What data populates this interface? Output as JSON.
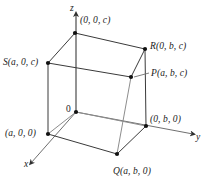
{
  "figure": {
    "colors": {
      "line": "#3a3a3a",
      "axis": "#4a4a4a",
      "vertex": "#111111",
      "text": "#1a1a1a",
      "background": "#ffffff"
    },
    "axes": [
      {
        "id": "x",
        "label": "x",
        "label_x": 24,
        "label_y": 166,
        "arrow": true
      },
      {
        "id": "y",
        "label": "y",
        "label_x": 196,
        "label_y": 139,
        "arrow": true
      },
      {
        "id": "z",
        "label": "z",
        "label_x": 70,
        "label_y": 5,
        "arrow": true
      }
    ],
    "points": [
      {
        "id": "top-back",
        "label": "(0, 0, c)",
        "label_x": 80,
        "label_y": 16,
        "px": 75,
        "py": 33,
        "dot": true
      },
      {
        "id": "R",
        "label": "R(0, b, c)",
        "label_x": 150,
        "label_y": 42,
        "px": 145,
        "py": 49,
        "dot": true
      },
      {
        "id": "S",
        "label": "S(a, 0, c)",
        "label_x": 3,
        "label_y": 58,
        "px": 48,
        "py": 63,
        "dot": true
      },
      {
        "id": "P",
        "label": "P(a, b, c)",
        "label_x": 151,
        "label_y": 69,
        "px": 131,
        "py": 77,
        "dot": true
      },
      {
        "id": "origin",
        "label": "0",
        "label_x": 66,
        "label_y": 105,
        "px": 76,
        "py": 112,
        "dot": true
      },
      {
        "id": "y-intercept",
        "label": "(0, b, 0)",
        "label_x": 150,
        "label_y": 115,
        "px": 146,
        "py": 126,
        "dot": true
      },
      {
        "id": "x-intercept",
        "label": "(a, 0, 0)",
        "label_x": 5,
        "label_y": 129,
        "px": 48,
        "py": 134,
        "dot": true
      },
      {
        "id": "Q",
        "label": "Q(a, b, 0)",
        "label_x": 113,
        "label_y": 167,
        "px": 117,
        "py": 154,
        "dot": true
      }
    ],
    "leader": {
      "from_x": 149,
      "from_y": 73,
      "to_x": 134,
      "to_y": 77
    }
  }
}
